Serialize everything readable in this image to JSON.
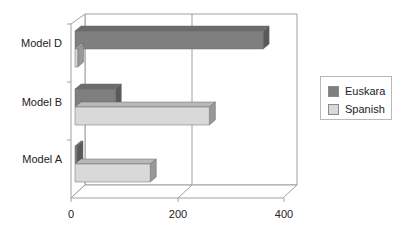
{
  "chart_data": {
    "type": "bar",
    "orientation": "horizontal",
    "style": "3d",
    "title": "",
    "xlabel": "",
    "ylabel": "",
    "categories": [
      "Model A",
      "Model B",
      "Model D"
    ],
    "series": [
      {
        "name": "Euskara",
        "values": [
          3,
          75,
          350
        ],
        "color": "#7f7f7f"
      },
      {
        "name": "Spanish",
        "values": [
          140,
          250,
          5
        ],
        "color": "#d9d9d9"
      }
    ],
    "xlim": [
      0,
      400
    ],
    "x_ticks": [
      "0",
      "200",
      "400"
    ],
    "grid": true,
    "legend_position": "right"
  },
  "legend": {
    "items": [
      {
        "label": "Euskara",
        "color": "#7f7f7f"
      },
      {
        "label": "Spanish",
        "color": "#d9d9d9"
      }
    ]
  },
  "axis": {
    "categories": [
      "Model D",
      "Model B",
      "Model A"
    ],
    "ticks": [
      "0",
      "200",
      "400"
    ]
  }
}
